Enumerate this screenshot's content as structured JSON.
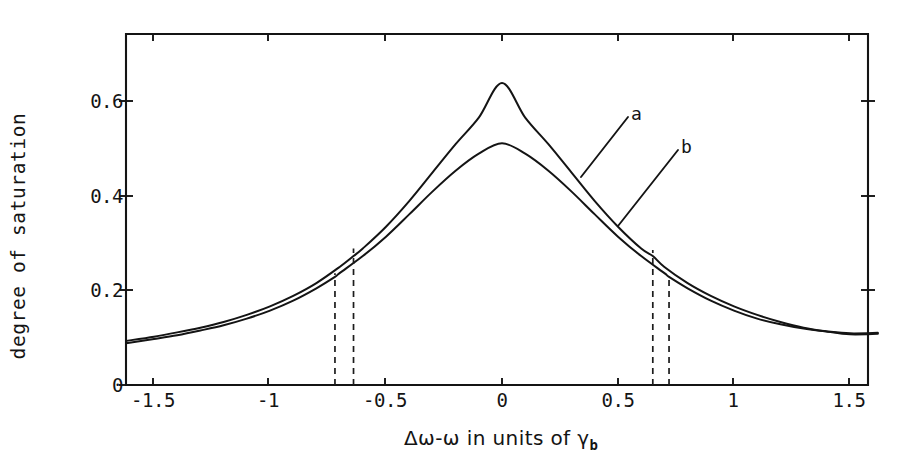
{
  "figure": {
    "background_color": "#ffffff",
    "ink_color": "#141414"
  },
  "axes": {
    "x_label_prefix": "Δω-ω in units of ",
    "x_label_symbol": "γ",
    "x_label_subscript": "b",
    "x_label_full": "Δω-ω in units of γb",
    "y_label": "degree of saturation",
    "x_ticks": [
      "-1.5",
      "-1",
      "-0.5",
      "0",
      "0.5",
      "1",
      "1.5"
    ],
    "y_ticks": [
      "0",
      "0.2",
      "0.4",
      "0.6"
    ]
  },
  "annotations": {
    "curve_a_label": "a",
    "curve_b_label": "b"
  },
  "chart_data": {
    "type": "line",
    "title": "",
    "xlabel": "Δω-ω in units of γb",
    "ylabel": "degree of saturation",
    "xlim": [
      -1.62,
      1.62
    ],
    "ylim": [
      0,
      0.73
    ],
    "xticks": [
      -1.5,
      -1,
      -0.5,
      0,
      0.5,
      1,
      1.5
    ],
    "yticks": [
      0,
      0.2,
      0.4,
      0.6
    ],
    "grid": false,
    "legend": "inline-labels",
    "series": [
      {
        "name": "a",
        "label": "a",
        "peak_value": 0.637,
        "peak_x": 0,
        "half_width_markers": [
          -0.64,
          0.65
        ],
        "x": [
          -1.62,
          -1.5,
          -1.4,
          -1.3,
          -1.2,
          -1.1,
          -1.0,
          -0.9,
          -0.8,
          -0.7,
          -0.64,
          -0.6,
          -0.5,
          -0.4,
          -0.3,
          -0.2,
          -0.1,
          0.0,
          0.1,
          0.2,
          0.3,
          0.4,
          0.5,
          0.6,
          0.65,
          0.7,
          0.8,
          0.9,
          1.0,
          1.1,
          1.2,
          1.3,
          1.4,
          1.5,
          1.62
        ],
        "values": [
          0.093,
          0.102,
          0.111,
          0.121,
          0.133,
          0.148,
          0.166,
          0.188,
          0.215,
          0.249,
          0.272,
          0.288,
          0.334,
          0.388,
          0.448,
          0.508,
          0.564,
          0.637,
          0.564,
          0.508,
          0.448,
          0.388,
          0.334,
          0.288,
          0.272,
          0.249,
          0.215,
          0.188,
          0.166,
          0.148,
          0.133,
          0.121,
          0.113,
          0.107,
          0.108
        ]
      },
      {
        "name": "b",
        "label": "b",
        "peak_value": 0.51,
        "peak_x": 0,
        "half_width_markers": [
          -0.72,
          0.72
        ],
        "x": [
          -1.62,
          -1.5,
          -1.4,
          -1.3,
          -1.2,
          -1.1,
          -1.0,
          -0.9,
          -0.8,
          -0.72,
          -0.7,
          -0.6,
          -0.5,
          -0.4,
          -0.3,
          -0.2,
          -0.1,
          0.0,
          0.1,
          0.2,
          0.3,
          0.4,
          0.5,
          0.6,
          0.7,
          0.72,
          0.8,
          0.9,
          1.0,
          1.1,
          1.2,
          1.3,
          1.4,
          1.5,
          1.62
        ],
        "values": [
          0.088,
          0.097,
          0.105,
          0.115,
          0.126,
          0.14,
          0.157,
          0.178,
          0.204,
          0.228,
          0.236,
          0.272,
          0.313,
          0.36,
          0.408,
          0.452,
          0.488,
          0.51,
          0.488,
          0.452,
          0.408,
          0.36,
          0.313,
          0.272,
          0.236,
          0.228,
          0.204,
          0.178,
          0.157,
          0.14,
          0.128,
          0.119,
          0.113,
          0.109,
          0.11
        ]
      }
    ],
    "dashed_markers": [
      {
        "x": -0.72,
        "y_top": 0.236,
        "belongs_to": "b"
      },
      {
        "x": -0.64,
        "y_top": 0.288,
        "belongs_to": "a"
      },
      {
        "x": 0.65,
        "y_top": 0.285,
        "belongs_to": "a"
      },
      {
        "x": 0.72,
        "y_top": 0.232,
        "belongs_to": "b"
      }
    ]
  }
}
